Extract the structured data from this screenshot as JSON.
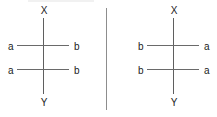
{
  "figure": {
    "type": "chemical-structure-pair",
    "background_color": "#ffffff",
    "line_color": "#5f5f5f",
    "text_color": "#1b1b1b",
    "divider_color": "#8d8d8d"
  },
  "panels": [
    {
      "id": "left",
      "name": "left-structure",
      "top_label": "X",
      "bottom_label": "Y",
      "rows": [
        {
          "left_label": "a",
          "right_label": "b"
        },
        {
          "left_label": "a",
          "right_label": "b"
        }
      ]
    },
    {
      "id": "right",
      "name": "right-structure",
      "top_label": "X",
      "bottom_label": "Y",
      "rows": [
        {
          "left_label": "b",
          "right_label": "a"
        },
        {
          "left_label": "b",
          "right_label": "a"
        }
      ]
    }
  ]
}
